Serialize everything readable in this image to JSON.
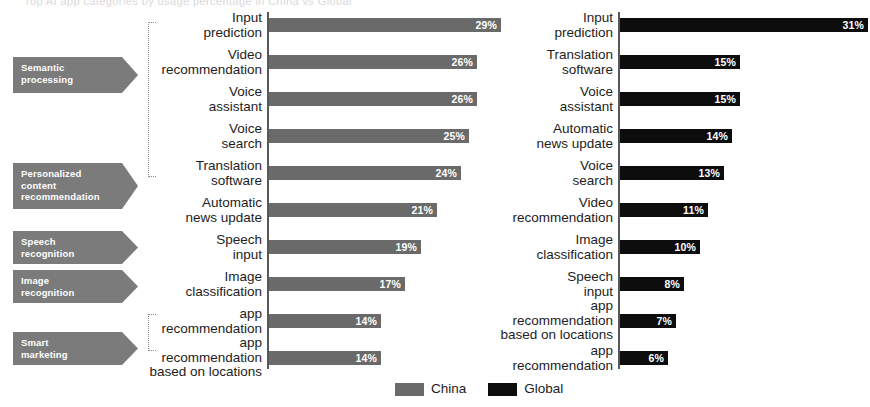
{
  "header": {
    "clipped_title": "Top AI app categories by usage percentage in China vs Global"
  },
  "categories": [
    {
      "name": "semantic-processing",
      "label": "Semantic\nprocessing",
      "x": 13,
      "y": 57,
      "width": 125,
      "height": 36
    },
    {
      "name": "personalized-content-recommendation",
      "label": "Personalized\ncontent\nrecommendation",
      "x": 13,
      "y": 163,
      "width": 125,
      "height": 46
    },
    {
      "name": "speech-recognition",
      "label": "Speech\nrecognition",
      "x": 13,
      "y": 231,
      "width": 125,
      "height": 33
    },
    {
      "name": "image-recognition",
      "label": "Image\nrecognition",
      "x": 13,
      "y": 270,
      "width": 125,
      "height": 33
    },
    {
      "name": "smart-marketing",
      "label": "Smart\nmarketing",
      "x": 13,
      "y": 332,
      "width": 125,
      "height": 33
    }
  ],
  "brackets": [
    {
      "name": "bracket-upper",
      "x": 148,
      "y": 22,
      "width": 8,
      "height": 155
    },
    {
      "name": "bracket-lower",
      "x": 148,
      "y": 314,
      "width": 8,
      "height": 37
    }
  ],
  "legend": {
    "items": [
      {
        "label": "China",
        "color": "#6a6a6a"
      },
      {
        "label": "Global",
        "color": "#0d0d0d"
      }
    ]
  },
  "chart_data": [
    {
      "name": "china",
      "type": "bar",
      "orientation": "horizontal",
      "title": "China",
      "xlabel": "",
      "ylabel": "",
      "unit": "%",
      "xlim": [
        0,
        32
      ],
      "grid": false,
      "legend_position": "bottom-center",
      "color": "#6a6a6a",
      "categories": [
        "Input\nprediction",
        "Video\nrecommendation",
        "Voice\nassistant",
        "Voice\nsearch",
        "Translation\nsoftware",
        "Automatic\nnews update",
        "Speech\ninput",
        "Image\nclassification",
        "app\nrecommendation",
        "app\nrecommendation\nbased on locations"
      ],
      "values": [
        29,
        26,
        26,
        25,
        24,
        21,
        19,
        17,
        14,
        14
      ],
      "labels": [
        "29%",
        "26%",
        "26%",
        "25%",
        "24%",
        "21%",
        "19%",
        "17%",
        "14%",
        "14%"
      ]
    },
    {
      "name": "global",
      "type": "bar",
      "orientation": "horizontal",
      "title": "Global",
      "xlabel": "",
      "ylabel": "",
      "unit": "%",
      "xlim": [
        0,
        32
      ],
      "grid": false,
      "legend_position": "bottom-center",
      "color": "#0d0d0d",
      "categories": [
        "Input\nprediction",
        "Translation\nsoftware",
        "Voice\nassistant",
        "Automatic\nnews update",
        "Voice\nsearch",
        "Video\nrecommendation",
        "Image\nclassification",
        "Speech\ninput",
        "app\nrecommendation\nbased on locations",
        "app\nrecommendation"
      ],
      "values": [
        31,
        15,
        15,
        14,
        13,
        11,
        10,
        8,
        7,
        6
      ],
      "labels": [
        "31%",
        "15%",
        "15%",
        "14%",
        "13%",
        "11%",
        "10%",
        "8%",
        "7%",
        "6%"
      ]
    }
  ]
}
